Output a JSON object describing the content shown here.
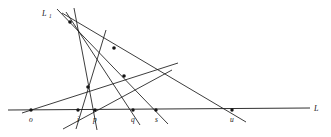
{
  "figure": {
    "width": 331,
    "height": 137,
    "background_color": "#ffffff",
    "ink_color": "#141414"
  },
  "labels": {
    "base_line": "L",
    "upper_line": "L",
    "upper_line_subscript": "1"
  },
  "base_points": [
    {
      "id": "o",
      "label": "o",
      "x": 31,
      "y": 110,
      "label_x": 29,
      "label_y": 122
    },
    {
      "id": "i",
      "label": "i",
      "x": 78,
      "y": 110,
      "label_x": 77,
      "label_y": 122
    },
    {
      "id": "p",
      "label": "p",
      "x": 95,
      "y": 110,
      "label_x": 93,
      "label_y": 122
    },
    {
      "id": "q",
      "label": "q",
      "x": 133,
      "y": 110,
      "label_x": 131,
      "label_y": 122
    },
    {
      "id": "s",
      "label": "s",
      "x": 156,
      "y": 110,
      "label_x": 155,
      "label_y": 122
    },
    {
      "id": "u",
      "label": "u",
      "x": 232,
      "y": 110,
      "label_x": 230,
      "label_y": 122
    }
  ],
  "intersection_nodes": [
    {
      "id": "apex",
      "x": 70,
      "y": 22
    },
    {
      "id": "upper-middle",
      "x": 114,
      "y": 48
    },
    {
      "id": "mid-right",
      "x": 124,
      "y": 76
    },
    {
      "id": "mid-left",
      "x": 88,
      "y": 87
    }
  ],
  "base_line_segment": {
    "x1": 8,
    "y1": 110,
    "x2": 310,
    "y2": 108
  },
  "transversals": [
    {
      "id": "line-apex-to-s",
      "x1": 57,
      "y1": 9,
      "x2": 168,
      "y2": 124
    },
    {
      "id": "line-apex-to-u",
      "x1": 62,
      "y1": 13,
      "x2": 246,
      "y2": 122
    },
    {
      "id": "line-apex-to-q",
      "x1": 66,
      "y1": 12,
      "x2": 140,
      "y2": 125
    },
    {
      "id": "line-through-i",
      "x1": 74,
      "y1": 8,
      "x2": 97,
      "y2": 130
    },
    {
      "id": "line-through-p",
      "x1": 106,
      "y1": 30,
      "x2": 76,
      "y2": 129
    },
    {
      "id": "line-o-to-upright",
      "x1": 22,
      "y1": 113,
      "x2": 178,
      "y2": 63
    },
    {
      "id": "line-lowleft-to-up",
      "x1": 63,
      "y1": 129,
      "x2": 172,
      "y2": 70
    }
  ],
  "label_positions": {
    "base_line_label": {
      "x": 314,
      "y": 111
    },
    "upper_line_label": {
      "x": 42,
      "y": 16
    },
    "upper_line_sub": {
      "x": 49,
      "y": 18
    }
  }
}
